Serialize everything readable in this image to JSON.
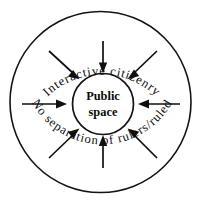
{
  "diagram": {
    "type": "concentric-circle-flow",
    "title_visible": false,
    "center": {
      "label_line1": "Public",
      "label_line2": "space",
      "shape": "circle"
    },
    "ring_labels": {
      "top": "Interactive citizenry",
      "bottom": "No separation of rulers/ruled"
    },
    "arrows": {
      "count": 8,
      "direction": "inward",
      "items": [
        {
          "name": "arrow-north",
          "angle_deg": 270,
          "label": ""
        },
        {
          "name": "arrow-northeast",
          "angle_deg": 315,
          "label": ""
        },
        {
          "name": "arrow-east",
          "angle_deg": 0,
          "label": ""
        },
        {
          "name": "arrow-southeast",
          "angle_deg": 45,
          "label": ""
        },
        {
          "name": "arrow-south",
          "angle_deg": 90,
          "label": ""
        },
        {
          "name": "arrow-southwest",
          "angle_deg": 135,
          "label": ""
        },
        {
          "name": "arrow-west",
          "angle_deg": 180,
          "label": ""
        },
        {
          "name": "arrow-northwest",
          "angle_deg": 225,
          "label": ""
        }
      ]
    },
    "colors": {
      "stroke": "#141414",
      "background": "#ffffff",
      "text": "#0d0d0d"
    }
  }
}
